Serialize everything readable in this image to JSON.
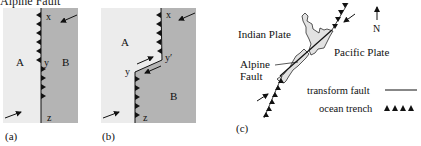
{
  "heading": "Alpine Fault",
  "panels": [
    {
      "id": "a",
      "caption": "(a)",
      "plates": {
        "left": "A",
        "right": "B"
      },
      "points": {
        "top": "x",
        "middle": "y",
        "bottom": "z"
      }
    },
    {
      "id": "b",
      "caption": "(b)",
      "plates": {
        "left": "A",
        "right": "B"
      },
      "points": {
        "top": "x",
        "middle_left": "y",
        "middle_right": "y′",
        "bottom": "z"
      }
    },
    {
      "id": "c",
      "caption": "(c)",
      "labels": {
        "indian_plate": "Indian Plate",
        "pacific_plate": "Pacific Plate",
        "alpine_fault_line1": "Alpine",
        "alpine_fault_line2": "Fault",
        "north": "N"
      },
      "legend": [
        {
          "label": "transform fault",
          "symbol": "line"
        },
        {
          "label": "ocean trench",
          "symbol": "triangles"
        }
      ]
    }
  ],
  "colors": {
    "plate_light": "#ececec",
    "plate_dark": "#b4b4b4",
    "land": "#e2e2e2",
    "ink": "#111111"
  }
}
